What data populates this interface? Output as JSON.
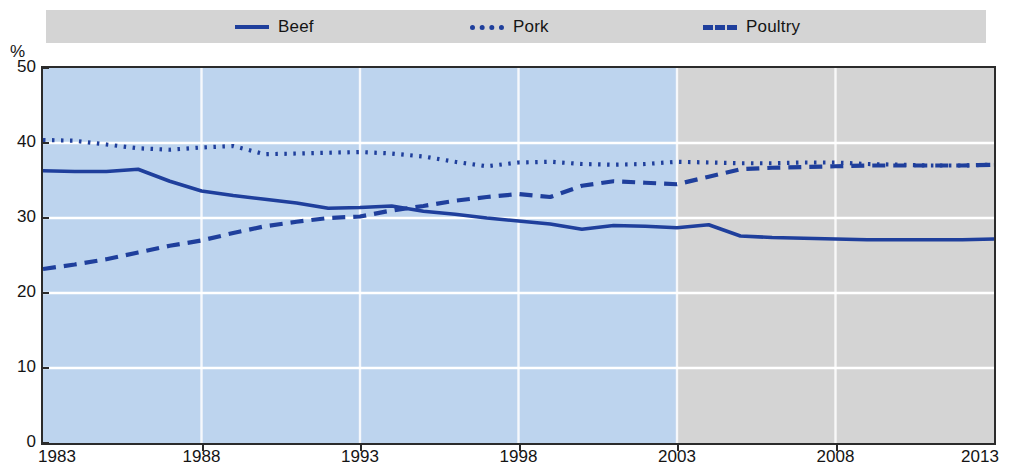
{
  "legend": {
    "items": [
      {
        "label": "Beef",
        "style": "solid",
        "color": "#1f3f9c",
        "icon": "solid-line-icon"
      },
      {
        "label": "Pork",
        "style": "dotted",
        "color": "#1f3f9c",
        "icon": "dotted-line-icon"
      },
      {
        "label": "Poultry",
        "style": "dashed",
        "color": "#1f3f9c",
        "icon": "dashed-line-icon"
      }
    ]
  },
  "axis": {
    "y_unit": "%",
    "y_ticks": [
      "0",
      "10",
      "20",
      "30",
      "40",
      "50"
    ],
    "x_ticks": [
      "1983",
      "1988",
      "1993",
      "1998",
      "2003",
      "2008",
      "2013"
    ]
  },
  "colors": {
    "line": "#1f3f9c",
    "history_band": "#bdd4ee",
    "projection_band": "#d4d4d4",
    "legend_band": "#d4d4d4",
    "gridline": "#ffffff",
    "frame": "#2b2b2b"
  },
  "chart_data": {
    "type": "line",
    "title": "",
    "subtitle": "",
    "xlabel": "",
    "ylabel": "%",
    "ylim": [
      0,
      50
    ],
    "xlim": [
      1983,
      2013
    ],
    "ytick_values": [
      0,
      10,
      20,
      30,
      40,
      50
    ],
    "xtick_values": [
      1983,
      1988,
      1993,
      1998,
      2003,
      2008,
      2013
    ],
    "grid": "horizontal",
    "legend_position": "top",
    "history_range": [
      1983,
      2003
    ],
    "projection_range": [
      2003,
      2013
    ],
    "x": [
      1983,
      1984,
      1985,
      1986,
      1987,
      1988,
      1989,
      1990,
      1991,
      1992,
      1993,
      1994,
      1995,
      1996,
      1997,
      1998,
      1999,
      2000,
      2001,
      2002,
      2003,
      2004,
      2005,
      2006,
      2007,
      2008,
      2009,
      2010,
      2011,
      2012,
      2013
    ],
    "series": [
      {
        "name": "Beef",
        "style": "solid",
        "values": [
          36.3,
          36.2,
          36.2,
          36.5,
          34.9,
          33.6,
          33.0,
          32.5,
          32.0,
          31.3,
          31.4,
          31.6,
          30.9,
          30.5,
          30.0,
          29.6,
          29.2,
          28.5,
          29.0,
          28.9,
          28.7,
          29.1,
          27.6,
          27.4,
          27.3,
          27.2,
          27.1,
          27.1,
          27.1,
          27.1,
          27.2
        ]
      },
      {
        "name": "Pork",
        "style": "dotted",
        "values": [
          40.4,
          40.3,
          39.8,
          39.3,
          39.1,
          39.4,
          39.6,
          38.5,
          38.6,
          38.7,
          38.8,
          38.6,
          38.2,
          37.5,
          36.9,
          37.4,
          37.5,
          37.2,
          37.1,
          37.2,
          37.5,
          37.4,
          37.3,
          37.3,
          37.4,
          37.4,
          37.2,
          37.1,
          37.0,
          37.0,
          37.1
        ]
      },
      {
        "name": "Poultry",
        "style": "dashed",
        "values": [
          23.2,
          23.8,
          24.5,
          25.4,
          26.3,
          27.0,
          28.0,
          28.9,
          29.5,
          30.0,
          30.2,
          31.0,
          31.6,
          32.3,
          32.8,
          33.2,
          32.8,
          34.3,
          34.9,
          34.7,
          34.5,
          35.5,
          36.5,
          36.7,
          36.8,
          36.9,
          37.0,
          37.0,
          37.0,
          37.0,
          37.1
        ]
      }
    ]
  }
}
